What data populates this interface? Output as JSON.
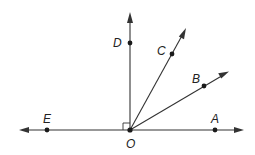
{
  "diagram": {
    "type": "rays-from-point",
    "origin": {
      "label": "O",
      "x": 130,
      "y": 130
    },
    "points": {
      "A": {
        "label": "A",
        "x": 215,
        "y": 130
      },
      "B": {
        "label": "B",
        "x": 204,
        "y": 86
      },
      "C": {
        "label": "C",
        "x": 172,
        "y": 54
      },
      "D": {
        "label": "D",
        "x": 130,
        "y": 43
      },
      "E": {
        "label": "E",
        "x": 47,
        "y": 130
      },
      "O": {
        "label": "O",
        "x": 130,
        "y": 130
      }
    },
    "rays": [
      {
        "name": "ray-OA",
        "from": "O",
        "through": "A",
        "tip": [
          243,
          130
        ]
      },
      {
        "name": "ray-OB",
        "from": "O",
        "through": "B",
        "tip": [
          228,
          72
        ]
      },
      {
        "name": "ray-OC",
        "from": "O",
        "through": "C",
        "tip": [
          186,
          28
        ]
      },
      {
        "name": "ray-OD",
        "from": "O",
        "through": "D",
        "tip": [
          130,
          13
        ]
      },
      {
        "name": "ray-OE",
        "from": "O",
        "through": "E",
        "tip": [
          20,
          130
        ]
      }
    ],
    "right_angle_marker": {
      "at": "O",
      "between": [
        "OD",
        "OE"
      ]
    },
    "labels": {
      "A": "A",
      "B": "B",
      "C": "C",
      "D": "D",
      "E": "E",
      "O": "O"
    },
    "colors": {
      "line": "#333333",
      "point": "#1a1a1a",
      "background": "#ffffff"
    }
  }
}
